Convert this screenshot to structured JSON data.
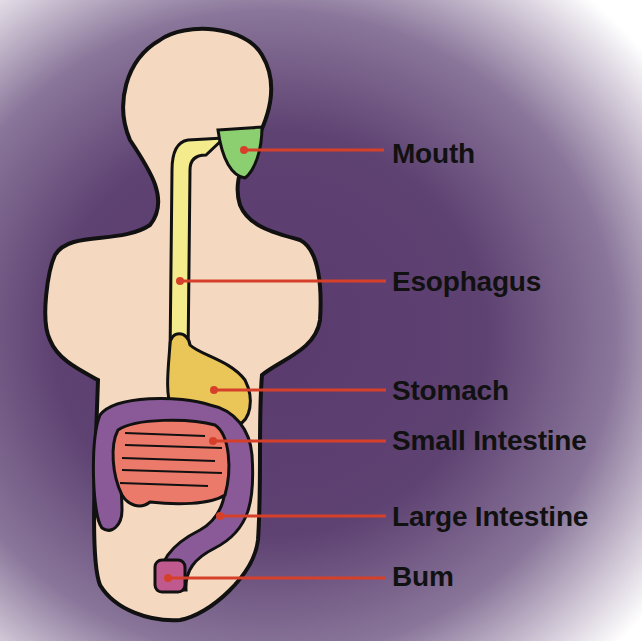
{
  "colors": {
    "background": "#5e4272",
    "body": "#f5d8c0",
    "outline": "#111111",
    "mouth": "#8ccf70",
    "esophagus": "#f4ec8c",
    "stomach": "#eac659",
    "small_intestine": "#ec7a6a",
    "large_intestine": "#8a5a98",
    "bum": "#c05a8e",
    "pointer": "#d6402a"
  },
  "labels": [
    {
      "id": "mouth",
      "text": "Mouth",
      "y": 154,
      "dot": [
        244,
        150
      ]
    },
    {
      "id": "esophagus",
      "text": "Esophagus",
      "y": 285,
      "dot": [
        180,
        281
      ]
    },
    {
      "id": "stomach",
      "text": "Stomach",
      "y": 392,
      "dot": [
        214,
        390
      ]
    },
    {
      "id": "small_intestine",
      "text": "Small Intestine",
      "y": 443,
      "dot": [
        213,
        441
      ]
    },
    {
      "id": "large_intestine",
      "text": "Large Intestine",
      "y": 518,
      "dot": [
        220,
        516
      ]
    },
    {
      "id": "bum",
      "text": "Bum",
      "y": 578,
      "dot": [
        168,
        578
      ]
    }
  ]
}
